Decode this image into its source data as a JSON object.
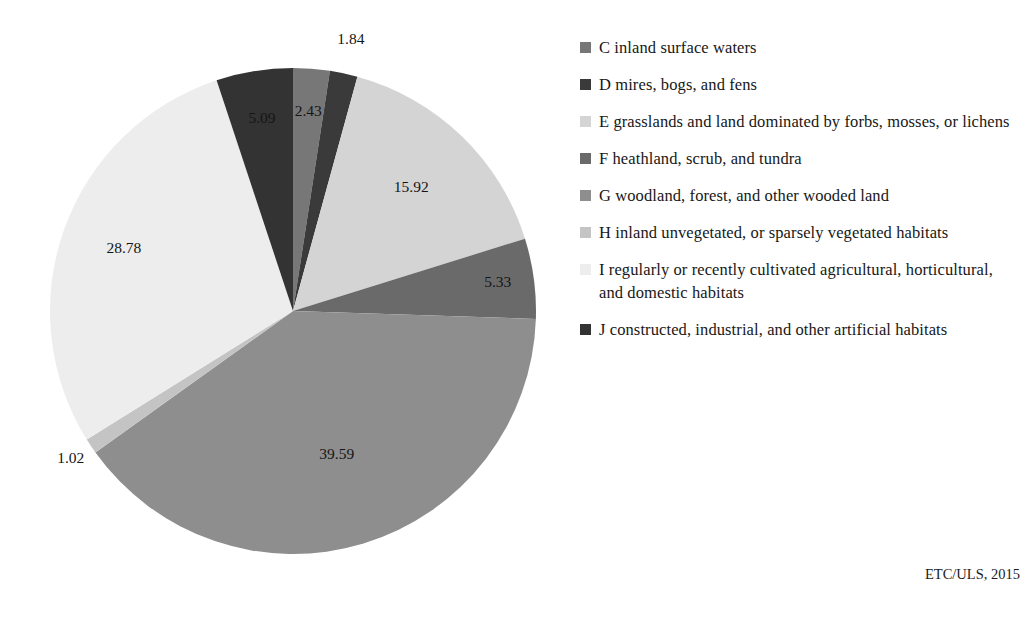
{
  "chart_data": {
    "type": "pie",
    "title": "",
    "subtitle": "",
    "xlabel": "",
    "ylabel": "",
    "legend_position": "right",
    "grid": false,
    "units": "percent",
    "start_angle_deg": 0,
    "direction": "clockwise",
    "categories": [
      "C inland surface waters",
      "D mires, bogs, and fens",
      "E grasslands and land dominated by forbs, mosses, or lichens",
      "F heathland, scrub, and tundra",
      "G woodland, forest, and other wooded land",
      "H inland unvegetated, or sparsely vegetated habitats",
      "I regularly or recently cultivated agricultural, horticultural, and domestic habitats",
      "J constructed, industrial, and other artificial habitats"
    ],
    "values": [
      2.43,
      1.84,
      15.92,
      5.33,
      39.59,
      1.02,
      28.78,
      5.09
    ],
    "labels": [
      "2.43",
      "1.84",
      "15.92",
      "5.33",
      "39.59",
      "1.02",
      "28.78",
      "5.09"
    ],
    "colors": [
      "#777777",
      "#3a3a3a",
      "#d4d4d4",
      "#6a6a6a",
      "#8e8e8e",
      "#c4c4c4",
      "#ededed",
      "#333333"
    ],
    "label_offsets": [
      {
        "r": 0.82,
        "outside": false
      },
      {
        "r": 1.14,
        "outside": true
      },
      {
        "r": 0.7,
        "outside": false
      },
      {
        "r": 0.85,
        "outside": false
      },
      {
        "r": 0.62,
        "outside": false
      },
      {
        "r": 1.1,
        "outside": true
      },
      {
        "r": 0.74,
        "outside": false
      },
      {
        "r": 0.8,
        "outside": false
      }
    ]
  },
  "legend": {
    "items": [
      {
        "key": "C",
        "label": "C inland surface waters",
        "color": "#777777"
      },
      {
        "key": "D",
        "label": "D mires, bogs, and fens",
        "color": "#3a3a3a"
      },
      {
        "key": "E",
        "label": "E grasslands and land dominated by forbs, mosses, or lichens",
        "color": "#d4d4d4"
      },
      {
        "key": "F",
        "label": "F heathland, scrub, and tundra",
        "color": "#6a6a6a"
      },
      {
        "key": "G",
        "label": "G woodland, forest, and other wooded land",
        "color": "#8e8e8e"
      },
      {
        "key": "H",
        "label": "H inland unvegetated, or sparsely vegetated habitats",
        "color": "#c4c4c4"
      },
      {
        "key": "I",
        "label": "I regularly or recently cultivated agricultural, horticultural, and domestic habitats",
        "color": "#ededed"
      },
      {
        "key": "J",
        "label": "J constructed, industrial, and other artificial habitats",
        "color": "#333333"
      }
    ]
  },
  "credit": {
    "text": "ETC/ULS, 2015"
  },
  "geometry": {
    "center_x": 293,
    "center_y": 311,
    "radius": 243
  }
}
